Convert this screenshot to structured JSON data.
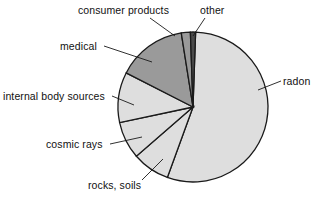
{
  "chart_data": {
    "type": "pie",
    "title": "",
    "subtitle": "",
    "xlabel": "",
    "ylabel": "",
    "legend_position": "none",
    "grid": false,
    "labels_placement": "outside-with-leader-lines",
    "center": {
      "x": 193,
      "y": 107
    },
    "radius": 75,
    "start_angle_deg": -90,
    "direction": "clockwise",
    "categories": [
      "radon",
      "rocks, soils",
      "cosmic rays",
      "internal body sources",
      "medical",
      "consumer products",
      "other"
    ],
    "values": [
      55,
      8,
      8,
      11,
      15,
      2,
      1
    ],
    "units": "percent",
    "slices": [
      {
        "label": "radon",
        "value": 55,
        "color": "#dedede",
        "start_deg": -88,
        "end_deg": 110
      },
      {
        "label": "rocks, soils",
        "value": 8,
        "color": "#dedede",
        "start_deg": 110,
        "end_deg": 139
      },
      {
        "label": "cosmic rays",
        "value": 8,
        "color": "#dedede",
        "start_deg": 139,
        "end_deg": 168
      },
      {
        "label": "internal body sources",
        "value": 11,
        "color": "#dedede",
        "start_deg": 168,
        "end_deg": 207
      },
      {
        "label": "medical",
        "value": 15,
        "color": "#9a9a9a",
        "start_deg": 207,
        "end_deg": 261
      },
      {
        "label": "consumer products",
        "value": 2,
        "color": "#9a9a9a",
        "start_deg": 261,
        "end_deg": 268
      },
      {
        "label": "other",
        "value": 1,
        "color": "#4a4a4a",
        "start_deg": 268,
        "end_deg": 272
      }
    ],
    "colors": {
      "light_gray": "#dedede",
      "mid_gray": "#9a9a9a",
      "dark_gray": "#4a4a4a",
      "outline": "#1a1a1a",
      "background": "#ffffff",
      "text": "#111111"
    }
  },
  "labels": {
    "consumer_products": "consumer products",
    "other": "other",
    "medical": "medical",
    "internal_body_sources": "internal body sources",
    "cosmic_rays": "cosmic rays",
    "rocks_soils": "rocks, soils",
    "radon": "radon"
  }
}
